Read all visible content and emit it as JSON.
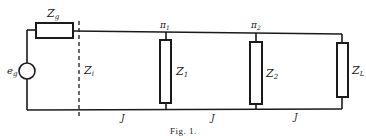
{
  "figure": {
    "caption": "Fig. 1.",
    "colors": {
      "ink": "#1a1a1a",
      "background": "#ffffff"
    }
  },
  "source": {
    "label_main": "e",
    "label_sub": "g"
  },
  "source_impedance": {
    "label_main": "Z",
    "label_sub": "g"
  },
  "input_impedance": {
    "label_main": "Z",
    "label_sub": "i"
  },
  "nodes": [
    {
      "label_main": "π",
      "label_sub": "1"
    },
    {
      "label_main": "π",
      "label_sub": "2"
    }
  ],
  "shunt_impedances": [
    {
      "label_main": "Z",
      "label_sub": "1"
    },
    {
      "label_main": "Z",
      "label_sub": "2"
    },
    {
      "label_main": "Z",
      "label_sub": "L"
    }
  ],
  "line_sections": [
    {
      "label": "J"
    },
    {
      "label": "J"
    },
    {
      "label": "J"
    }
  ]
}
